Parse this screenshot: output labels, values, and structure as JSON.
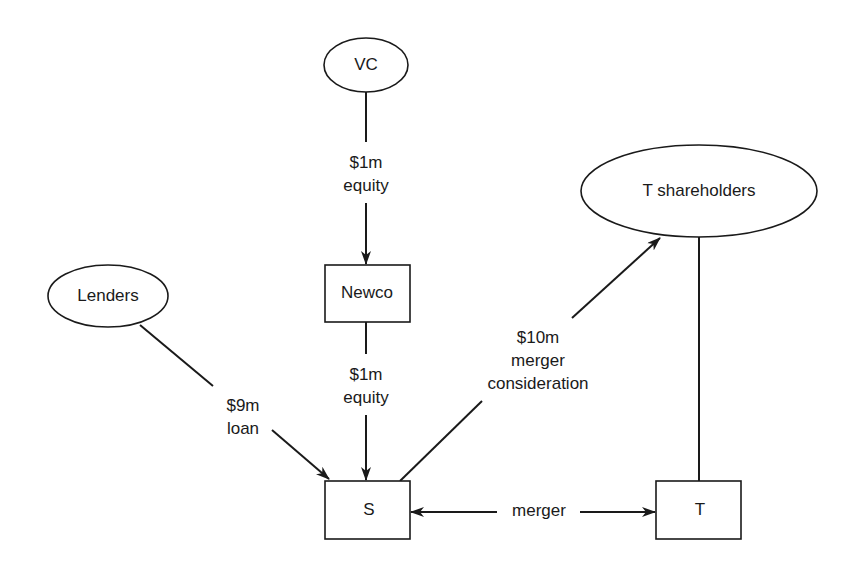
{
  "nodes": {
    "vc": {
      "label": "VC",
      "shape": "ellipse"
    },
    "lenders": {
      "label": "Lenders",
      "shape": "ellipse"
    },
    "t_shareholders": {
      "label": "T shareholders",
      "shape": "ellipse"
    },
    "newco": {
      "label": "Newco",
      "shape": "rectangle"
    },
    "s": {
      "label": "S",
      "shape": "rectangle"
    },
    "t": {
      "label": "T",
      "shape": "rectangle"
    }
  },
  "edges": {
    "vc_to_newco": {
      "from": "VC",
      "to": "Newco",
      "line1": "$1m",
      "line2": "equity"
    },
    "newco_to_s": {
      "from": "Newco",
      "to": "S",
      "line1": "$1m",
      "line2": "equity"
    },
    "lenders_to_s": {
      "from": "Lenders",
      "to": "S",
      "line1": "$9m",
      "line2": "loan"
    },
    "s_to_t_shareholders": {
      "from": "S",
      "to": "T shareholders",
      "line1": "$10m",
      "line2": "merger",
      "line3": "consideration"
    },
    "s_t_merger": {
      "from": "S",
      "to": "T",
      "label": "merger",
      "bidirectional": true
    },
    "t_shareholders_t": {
      "from": "T shareholders",
      "to": "T",
      "label": ""
    }
  },
  "colors": {
    "stroke": "#1a1a1a",
    "background": "#ffffff"
  }
}
